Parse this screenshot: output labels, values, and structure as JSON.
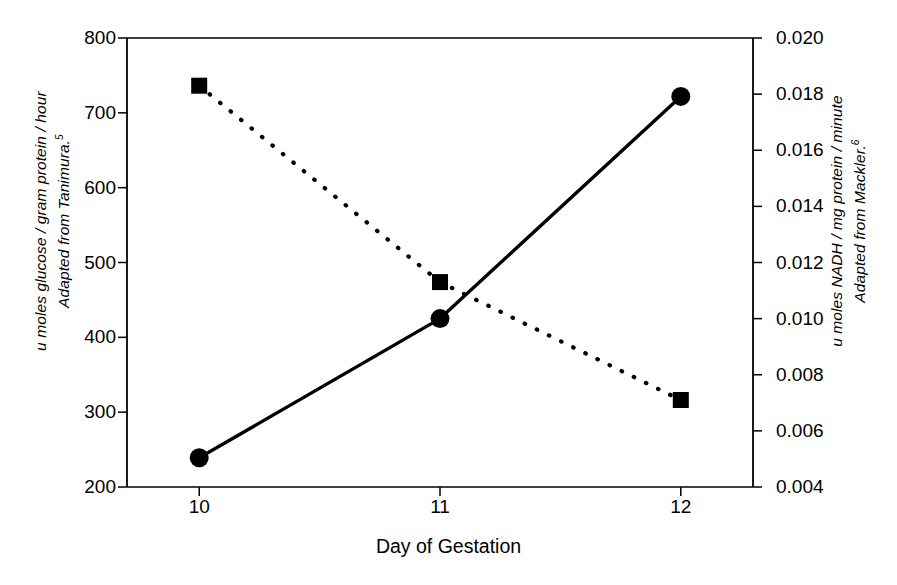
{
  "chart_data": {
    "type": "line",
    "title": "",
    "xlabel": "Day of Gestation",
    "x": [
      10,
      11,
      12
    ],
    "x_tick_labels": [
      "10",
      "11",
      "12"
    ],
    "xlim": [
      9.7,
      12.3
    ],
    "grid": false,
    "legend": "none",
    "axes": [
      {
        "side": "left",
        "ylabel_line1": "u moles glucose / gram protein / hour",
        "ylabel_line2": "Adapted from Tanimura.",
        "ylabel_superscript": "5",
        "ylim": [
          200,
          800
        ],
        "ytick_labels": [
          "800",
          "700",
          "600",
          "500",
          "400",
          "300",
          "200"
        ],
        "yticks": [
          800,
          700,
          600,
          500,
          400,
          300,
          200
        ]
      },
      {
        "side": "right",
        "ylabel_line1": "u moles NADH / mg protein / minute",
        "ylabel_line2": "Adapted from Mackler.",
        "ylabel_superscript": "6",
        "ylim": [
          0.004,
          0.02
        ],
        "ytick_labels": [
          "0.020",
          "0.018",
          "0.016",
          "0.014",
          "0.012",
          "0.010",
          "0.008",
          "0.006",
          "0.004"
        ],
        "yticks": [
          0.02,
          0.018,
          0.016,
          0.014,
          0.012,
          0.01,
          0.008,
          0.006,
          0.004
        ]
      }
    ],
    "series": [
      {
        "name": "u moles glucose / gram protein / hour",
        "axis": "left",
        "marker": "circle",
        "linestyle": "solid",
        "color": "#000000",
        "values": [
          239,
          425,
          722
        ]
      },
      {
        "name": "u moles NADH / mg protein / minute",
        "axis": "right",
        "marker": "square",
        "linestyle": "dotted",
        "color": "#000000",
        "values": [
          0.0183,
          0.0113,
          0.0071
        ]
      }
    ]
  },
  "colors": {
    "ink": "#000000",
    "background": "#ffffff"
  }
}
